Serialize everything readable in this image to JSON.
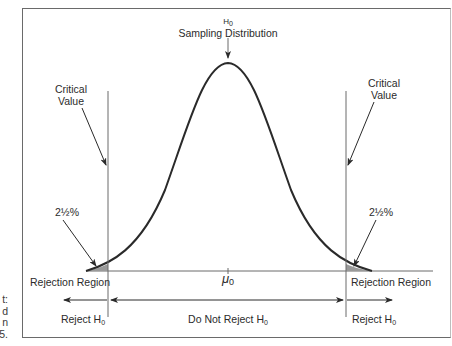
{
  "diagram": {
    "title_symbol": "H",
    "title_sub": "0",
    "title": "Sampling Distribution",
    "critical_value_left": [
      "Critical",
      "Value"
    ],
    "critical_value_right": [
      "Critical",
      "Value"
    ],
    "tail_pct_left": "2½%",
    "tail_pct_right": "2½%",
    "rejection_region_left": "Rejection Region",
    "rejection_region_right": "Rejection Region",
    "mean_symbol": "μ",
    "mean_sub": "0",
    "reject_left": "Reject H",
    "reject_left_sub": "0",
    "do_not_reject": "Do Not Reject H",
    "do_not_reject_sub": "0",
    "reject_right": "Reject H",
    "reject_right_sub": "0",
    "side_caption_fragments": [
      "t:",
      "d",
      "n",
      "5."
    ],
    "colors": {
      "line": "#2a2a2a",
      "shade": "#9a9a9a",
      "frame": "#6a6a6a"
    }
  }
}
